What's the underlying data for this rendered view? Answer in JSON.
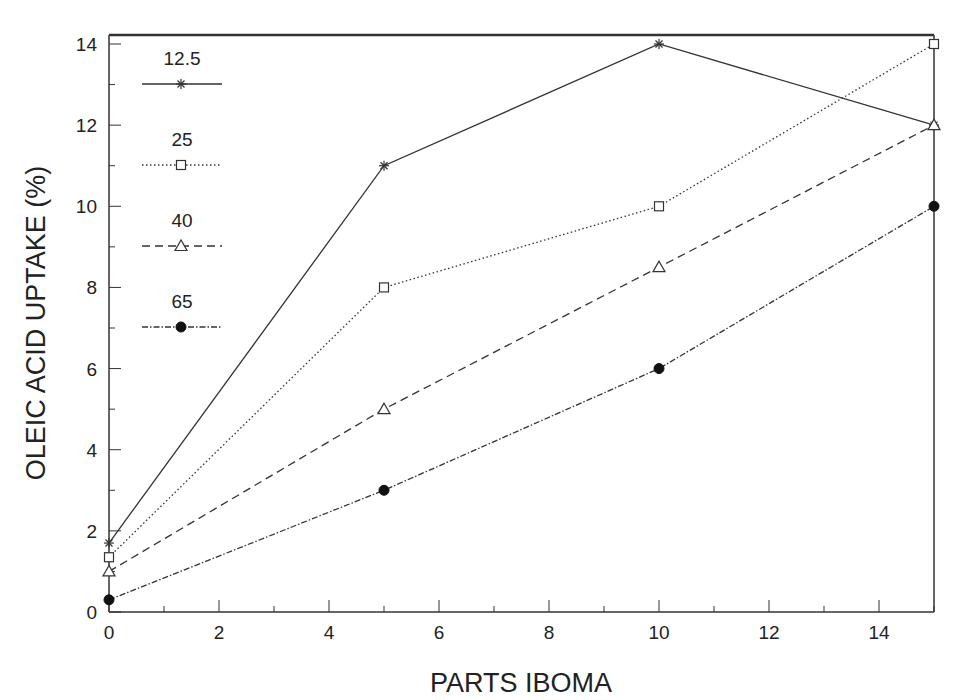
{
  "chart_data": {
    "type": "line",
    "title": "",
    "xlabel": "PARTS IBOMA",
    "ylabel": "OLEIC ACID UPTAKE (%)",
    "xlim": [
      0,
      15
    ],
    "ylim": [
      0,
      14.2
    ],
    "x_ticks": [
      0,
      2,
      4,
      6,
      8,
      10,
      12,
      14
    ],
    "y_ticks": [
      0,
      2,
      4,
      6,
      8,
      10,
      12,
      14
    ],
    "grid": false,
    "legend_position": "upper left",
    "x": [
      0,
      5,
      10,
      15
    ],
    "series": [
      {
        "name": "12.5",
        "marker": "star",
        "linestyle": "solid",
        "values": [
          1.7,
          11,
          14,
          12
        ]
      },
      {
        "name": "25",
        "marker": "square",
        "linestyle": "dotted",
        "values": [
          1.35,
          8,
          10,
          14
        ]
      },
      {
        "name": "40",
        "marker": "triangle",
        "linestyle": "dashed",
        "values": [
          1.0,
          5,
          8.5,
          12
        ]
      },
      {
        "name": "65",
        "marker": "filled-circle",
        "linestyle": "dash-dot",
        "values": [
          0.3,
          3,
          6,
          10
        ]
      }
    ]
  },
  "colors": {
    "line": "#333333",
    "axis": "#333333",
    "background": "#ffffff"
  }
}
